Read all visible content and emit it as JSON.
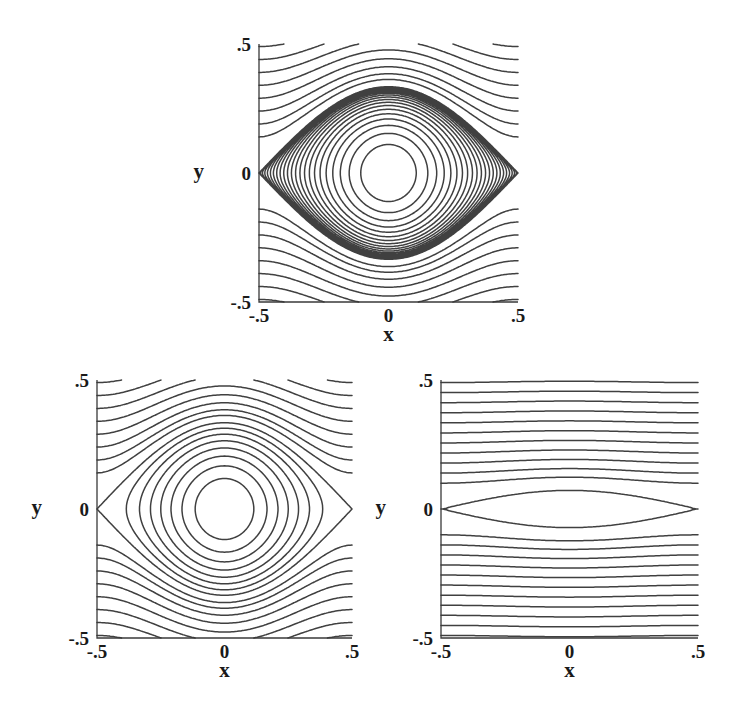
{
  "chart_data": [
    {
      "id": "top",
      "type": "contour",
      "title": "",
      "xlabel": "x",
      "ylabel": "y",
      "xlim": [
        -0.5,
        0.5
      ],
      "ylim": [
        -0.5,
        0.5
      ],
      "x_ticks": [
        "-.5",
        "0",
        ".5"
      ],
      "y_ticks": [
        ".5",
        "0",
        "-.5"
      ],
      "grid": false,
      "description": "Streamlines: cat's-eye vortex with separatrix touching x=±0.5, y=0; densely packed closed contours concentrating at the centre (0,0); open wavy streamlines above and below",
      "amplitude": 0.028,
      "center_concentration": 2.6,
      "closed_levels": 22,
      "open_levels": 8,
      "frame_px": {
        "left": 259,
        "top": 44,
        "right": 518,
        "bottom": 302
      }
    },
    {
      "id": "bottom-left",
      "type": "contour",
      "title": "",
      "xlabel": "x",
      "ylabel": "y",
      "xlim": [
        -0.5,
        0.5
      ],
      "ylim": [
        -0.5,
        0.5
      ],
      "x_ticks": [
        "-.5",
        "0",
        ".5"
      ],
      "y_ticks": [
        ".5",
        "0",
        "-.5"
      ],
      "grid": false,
      "description": "Streamlines: cat's-eye vortex with separatrix touching x=±0.5, y=0; about 7 evenly spaced closed contours around an empty core; open wavy streamlines above and below",
      "amplitude": 0.028,
      "center_concentration": 1.0,
      "closed_levels": 7,
      "open_levels": 8,
      "frame_px": {
        "left": 97,
        "top": 380,
        "right": 352,
        "bottom": 638
      }
    },
    {
      "id": "bottom-right",
      "type": "contour",
      "title": "",
      "xlabel": "x",
      "ylabel": "y",
      "xlim": [
        -0.5,
        0.5
      ],
      "ylim": [
        -0.5,
        0.5
      ],
      "x_ticks": [
        "-.5",
        "0",
        ".5"
      ],
      "y_ticks": [
        ".5",
        "0",
        "-.5"
      ],
      "grid": false,
      "description": "Streamlines: thin lens-shaped separatrix from (-0.5,0) to (0.5,0) with maximum half-width ≈0.07; nearly straight horizontal streamlines above and below",
      "amplitude": 0.0013,
      "center_concentration": 1.0,
      "closed_levels": 0,
      "open_levels": 11,
      "frame_px": {
        "left": 441,
        "top": 380,
        "right": 698,
        "bottom": 638
      }
    }
  ],
  "panels": [
    {
      "xlabel": "x",
      "ylabel": "y",
      "x_ticks": [
        "-.5",
        "0",
        ".5"
      ],
      "y_ticks": [
        ".5",
        "0",
        "-.5"
      ]
    },
    {
      "xlabel": "x",
      "ylabel": "y",
      "x_ticks": [
        "-.5",
        "0",
        ".5"
      ],
      "y_ticks": [
        ".5",
        "0",
        "-.5"
      ]
    },
    {
      "xlabel": "x",
      "ylabel": "y",
      "x_ticks": [
        "-.5",
        "0",
        ".5"
      ],
      "y_ticks": [
        ".5",
        "0",
        "-.5"
      ]
    }
  ],
  "colors": {
    "line": "#404040",
    "frame": "#3a3a3a",
    "background": "#ffffff"
  }
}
